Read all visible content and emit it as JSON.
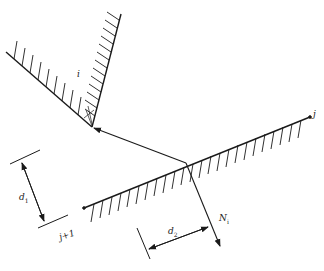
{
  "figure": {
    "colors": {
      "line": "#1a1a1a",
      "background": "#ffffff"
    },
    "labels": {
      "wall_i": "i",
      "wall_j": "j",
      "wall_j_plus_1": "j+1",
      "d1": "d",
      "d1_sub": "1",
      "d2": "d",
      "d2_sub": "2",
      "normal": "N",
      "normal_sub": "i"
    }
  }
}
